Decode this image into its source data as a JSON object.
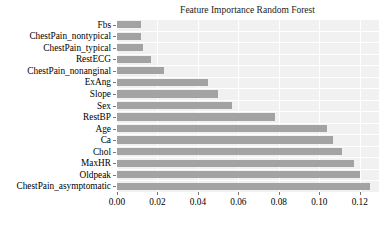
{
  "chart_data": {
    "type": "bar",
    "orientation": "horizontal",
    "title": "Feature Importance Random Forest",
    "xlabel": "",
    "ylabel": "",
    "categories": [
      "Fbs",
      "ChestPain_nontypical",
      "ChestPain_typical",
      "RestECG",
      "ChestPain_nonanginal",
      "ExAng",
      "Slope",
      "Sex",
      "RestBP",
      "Age",
      "Ca",
      "Chol",
      "MaxHR",
      "Oldpeak",
      "ChestPain_asymptomatic"
    ],
    "values": [
      0.012,
      0.012,
      0.013,
      0.017,
      0.023,
      0.045,
      0.05,
      0.057,
      0.078,
      0.104,
      0.107,
      0.111,
      0.117,
      0.12,
      0.125
    ],
    "xlim": [
      0.0,
      0.1295
    ],
    "ylim_categories_order": "ascending-downward",
    "xticks": [
      0.0,
      0.02,
      0.04,
      0.06,
      0.08,
      0.1,
      0.12
    ],
    "xtick_labels": [
      "0.00",
      "0.02",
      "0.04",
      "0.06",
      "0.08",
      "0.10",
      "0.12"
    ],
    "grid": true,
    "grid_color": "#ffffff",
    "legend": null,
    "bar_color": "#a3a3a3",
    "plot_background": "#f1f1f1",
    "figure_background": "#ffffff"
  }
}
